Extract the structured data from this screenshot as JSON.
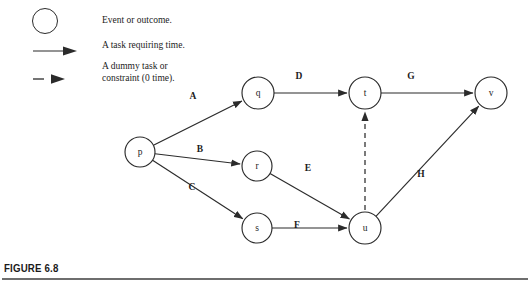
{
  "figure": {
    "caption": "FIGURE 6.8",
    "accent_color": "#2b2b2b",
    "rule_color": "#6e6e6e"
  },
  "legend": {
    "title": "",
    "items": [
      {
        "glyph": "circle-outline",
        "icon_name": "event-circle-icon",
        "text": "Event or outcome."
      },
      {
        "glyph": "solid-arrow",
        "icon_name": "solid-arrow-icon",
        "text": "A task requiring time."
      },
      {
        "glyph": "dashed-arrow",
        "icon_name": "dashed-arrow-icon",
        "text": "A dummy task or\nconstraint (0 time)."
      }
    ]
  },
  "chart_data": {
    "type": "diagram",
    "subtype": "activity-on-arrow network (PERT/CPM)",
    "title": "FIGURE 6.8",
    "nodes": [
      {
        "id": "p",
        "label": "p",
        "x": 140,
        "y": 152,
        "r": 15
      },
      {
        "id": "q",
        "label": "q",
        "x": 258,
        "y": 93,
        "r": 16
      },
      {
        "id": "r",
        "label": "r",
        "x": 257,
        "y": 166,
        "r": 15
      },
      {
        "id": "s",
        "label": "s",
        "x": 257,
        "y": 228,
        "r": 15
      },
      {
        "id": "t",
        "label": "t",
        "x": 365,
        "y": 93,
        "r": 16
      },
      {
        "id": "u",
        "label": "u",
        "x": 365,
        "y": 228,
        "r": 16
      },
      {
        "id": "v",
        "label": "v",
        "x": 491,
        "y": 93,
        "r": 16
      }
    ],
    "edges": [
      {
        "label": "A",
        "from": "p",
        "to": "q",
        "kind": "task",
        "lx": 193,
        "ly": 99
      },
      {
        "label": "B",
        "from": "p",
        "to": "r",
        "kind": "task",
        "lx": 200,
        "ly": 152
      },
      {
        "label": "C",
        "from": "p",
        "to": "s",
        "kind": "task",
        "lx": 192,
        "ly": 190
      },
      {
        "label": "D",
        "from": "q",
        "to": "t",
        "kind": "task",
        "lx": 299,
        "ly": 79
      },
      {
        "label": "E",
        "from": "r",
        "to": "u",
        "kind": "task",
        "lx": 308,
        "ly": 171
      },
      {
        "label": "F",
        "from": "s",
        "to": "u",
        "kind": "task",
        "lx": 297,
        "ly": 228
      },
      {
        "label": "G",
        "from": "t",
        "to": "v",
        "kind": "task",
        "lx": 411,
        "ly": 79
      },
      {
        "label": "H",
        "from": "u",
        "to": "v",
        "kind": "task",
        "lx": 421,
        "ly": 177
      },
      {
        "label": "",
        "from": "u",
        "to": "t",
        "kind": "dummy",
        "lx": 0,
        "ly": 0
      }
    ],
    "legend_entries": [
      "Event or outcome.",
      "A task requiring time.",
      "A dummy task or constraint (0 time)."
    ]
  }
}
